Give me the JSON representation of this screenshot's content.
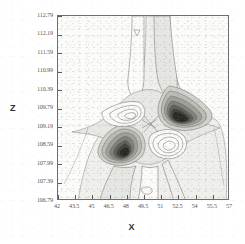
{
  "figure": {
    "kind": "contour-plot",
    "background_color": "#ffffff",
    "plot_background_color": "#fbfbfa",
    "frame_color": "#6e6e6e",
    "tick_label_color": "#58585a",
    "axis_title_color": "#2e2e2e"
  },
  "chart_data": {
    "type": "heatmap",
    "subtype": "filled-contour",
    "title": "",
    "subtitle": "",
    "xlabel": "X",
    "ylabel": "Z",
    "xlim": [
      42,
      57
    ],
    "ylim": [
      106.79,
      112.79
    ],
    "xticks": [
      42,
      43.5,
      45,
      46.5,
      48,
      49.5,
      51,
      52.5,
      54,
      55.5,
      57
    ],
    "yticks": [
      112.79,
      112.19,
      111.59,
      110.99,
      110.39,
      109.79,
      109.19,
      108.59,
      107.99,
      107.39,
      106.79
    ],
    "xtick_labels": [
      "42",
      "43.5",
      "45",
      "46.5",
      "48",
      "49.5",
      "51",
      "52.5",
      "54",
      "55.5",
      "57"
    ],
    "ytick_labels": [
      "112.79",
      "112.19",
      "111.59",
      "110.99",
      "110.39",
      "109.79",
      "109.19",
      "108.59",
      "107.99",
      "107.39",
      "106.79"
    ],
    "xtick_step": 1.5,
    "ytick_step": 0.6,
    "grid": false,
    "legend": false,
    "colorbar": false,
    "colormap": "grayscale",
    "contour_line_color": "#6a6a6a",
    "fill_levels": [
      "#fbfbfa",
      "#ededea",
      "#dcdcd8",
      "#c3c3bd",
      "#a3a39c",
      "#7f7f78",
      "#5d5d57",
      "#3d3d39",
      "#232321"
    ],
    "features": [
      {
        "name": "positive-lobe-right",
        "label": "dark maximum lobe (right of center)",
        "center_x": 51.2,
        "center_z": 109.85,
        "peak_level": 8
      },
      {
        "name": "negative-lobe-left",
        "label": "dark minimum lobe (left of center, below)",
        "center_x": 48.1,
        "center_z": 109.35,
        "peak_level": 8
      },
      {
        "name": "saddle-point",
        "label": "central saddle between lobes",
        "center_x": 49.7,
        "center_z": 109.6,
        "peak_level": 0
      },
      {
        "name": "upper-ridge-left",
        "label": "narrow vertical band upper-left of center",
        "center_x": 49.3,
        "center_z": 111.6,
        "peak_level": 1
      },
      {
        "name": "upper-ridge-right",
        "label": "narrow vertical band upper-right of center",
        "center_x": 50.6,
        "center_z": 111.6,
        "peak_level": 2
      },
      {
        "name": "lower-tail",
        "label": "broad band descending to lower boundary",
        "center_x": 49.4,
        "center_z": 107.6,
        "peak_level": 2
      }
    ]
  }
}
